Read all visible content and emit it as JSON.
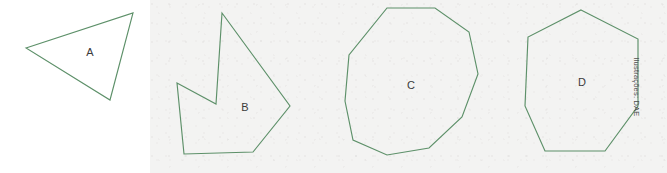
{
  "figure": {
    "width": 667,
    "height": 173,
    "background_color": "#ffffff",
    "panel_color": "#f3f2f1",
    "stroke_color": "#5d9069",
    "label_color": "#3b3b3b"
  },
  "credit": {
    "text": "Ilustrações: DAE"
  },
  "shapes": [
    {
      "id": "shape-a",
      "label": "A",
      "name": "triangle",
      "sides": 3,
      "label_x": 90,
      "label_y": 52,
      "points": "26,48 133,13 110,100"
    },
    {
      "id": "shape-b",
      "label": "B",
      "name": "concave-heptagon",
      "sides": 7,
      "label_x": 245,
      "label_y": 107,
      "points": "222,13 290,106 253,152 184,154 177,83 216,104"
    },
    {
      "id": "shape-c",
      "label": "C",
      "name": "decagon",
      "sides": 10,
      "label_x": 411,
      "label_y": 85,
      "points": "387,8 435,8 469,32 478,74 462,117 429,148 387,155 353,140 345,101 349,55"
    },
    {
      "id": "shape-d",
      "label": "D",
      "name": "heptagon",
      "sides": 7,
      "label_x": 582,
      "label_y": 82,
      "points": "581,10 638,39 638,106 605,151 545,151 525,106 528,37"
    }
  ]
}
